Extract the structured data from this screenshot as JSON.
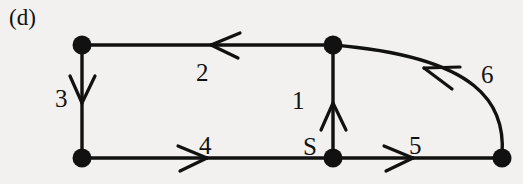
{
  "figure": {
    "panel_label": "(d)",
    "background_color": "#f2f1ef",
    "ink_color": "#111111"
  },
  "graph": {
    "node_label_s": "S",
    "nodes": [
      {
        "id": "top-left",
        "label": "",
        "x": 82,
        "y": 45,
        "r": 9
      },
      {
        "id": "top-middle",
        "label": "",
        "x": 333,
        "y": 45,
        "r": 9
      },
      {
        "id": "bottom-left",
        "label": "",
        "x": 82,
        "y": 158,
        "r": 9
      },
      {
        "id": "bottom-s",
        "label": "S",
        "x": 333,
        "y": 158,
        "r": 9
      },
      {
        "id": "bottom-right",
        "label": "",
        "x": 502,
        "y": 158,
        "r": 9
      }
    ],
    "edges": [
      {
        "id": 1,
        "label": "1",
        "from": "bottom-s",
        "to": "top-middle",
        "shape": "straight",
        "direction": "up"
      },
      {
        "id": 2,
        "label": "2",
        "from": "top-middle",
        "to": "top-left",
        "shape": "straight",
        "direction": "left"
      },
      {
        "id": 3,
        "label": "3",
        "from": "top-left",
        "to": "bottom-left",
        "shape": "straight",
        "direction": "down"
      },
      {
        "id": 4,
        "label": "4",
        "from": "bottom-left",
        "to": "bottom-s",
        "shape": "straight",
        "direction": "right"
      },
      {
        "id": 5,
        "label": "5",
        "from": "bottom-s",
        "to": "bottom-right",
        "shape": "straight",
        "direction": "right"
      },
      {
        "id": 6,
        "label": "6",
        "from": "bottom-right",
        "to": "top-middle",
        "shape": "curved",
        "direction": "up-left"
      }
    ]
  }
}
